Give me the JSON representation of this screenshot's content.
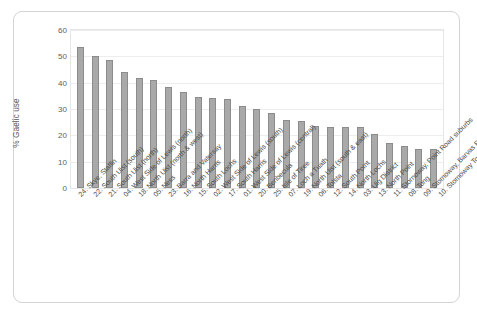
{
  "chart_data": {
    "type": "bar",
    "title": "",
    "xlabel": "",
    "ylabel": "% Gaelic use",
    "ylim": [
      0,
      60
    ],
    "yticks": [
      0,
      10,
      20,
      30,
      40,
      50,
      60
    ],
    "grid": true,
    "legend": false,
    "bar_color": "#a9a9a9",
    "bar_border_color": "#8c8c8c",
    "categories": [
      "24. Skye, Staffin",
      "22. South Uist (south)",
      "21. South Uist (north)",
      "04. West Side of Lewis (north)",
      "18. North Uist (north & west)",
      "05. Ness",
      "23. Barra and Vatersay",
      "16. North Harris",
      "15. South Lochs",
      "02. West Side of Lewis (south)",
      "17. South Harris",
      "01. West Side of Lewis (central)",
      "20. Benbecula",
      "25. Isle of Tiree",
      "07. Loch a Tuath",
      "19. North Uist (south & east)",
      "06. Tolsta",
      "12. South Point",
      "14. North Lochs",
      "03. Uig District",
      "13. North Point",
      "11. Stornoway, Point Road suburbs",
      "08. Tong",
      "09. Stornoway, Barvas Road suburbs",
      "10. Stornoway Town"
    ],
    "values": [
      53.5,
      50.0,
      48.5,
      44.0,
      41.8,
      41.2,
      38.5,
      36.5,
      34.5,
      34.2,
      33.8,
      31.0,
      30.0,
      28.5,
      26.0,
      25.5,
      23.5,
      23.2,
      23.0,
      23.0,
      20.5,
      17.2,
      15.8,
      15.0,
      15.0
    ]
  }
}
